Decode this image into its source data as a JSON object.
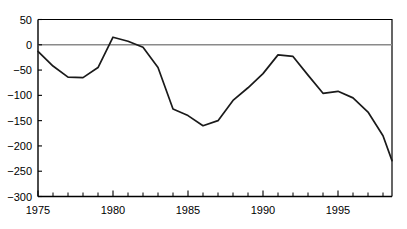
{
  "chart_data": {
    "type": "line",
    "title": "",
    "subtitle": "",
    "xlabel": "",
    "ylabel": "",
    "xlim": [
      1975,
      1998.6
    ],
    "ylim": [
      -300,
      50
    ],
    "grid": false,
    "legend": null,
    "zero_reference_line": 0,
    "y_ticks": [
      50,
      0,
      -50,
      -100,
      -150,
      -200,
      -250,
      -300
    ],
    "y_tick_labels": [
      "50",
      "0",
      "-50",
      "-100",
      "-150",
      "-200",
      "-250",
      "-300"
    ],
    "x_ticks": [
      1975,
      1980,
      1985,
      1990,
      1995
    ],
    "x_tick_labels": [
      "1975",
      "1980",
      "1985",
      "1990",
      "1995"
    ],
    "x_minor_tick_step": 1,
    "series": [
      {
        "name": "series-1",
        "color": "#1a1a1a",
        "x": [
          1975,
          1976,
          1977,
          1978,
          1979,
          1980,
          1981,
          1982,
          1983,
          1984,
          1985,
          1986,
          1987,
          1988,
          1989,
          1990,
          1991,
          1992,
          1993,
          1994,
          1995,
          1996,
          1997,
          1998,
          1998.6
        ],
        "values": [
          -13,
          -42,
          -64,
          -65,
          -45,
          15,
          7,
          -5,
          -45,
          -127,
          -140,
          -160,
          -150,
          -110,
          -85,
          -57,
          -20,
          -23,
          -60,
          -96,
          -92,
          -105,
          -133,
          -180,
          -229
        ]
      }
    ]
  },
  "axis_colors": {
    "axis": "#000000",
    "zero_line": "#8a8a8a",
    "series": "#1a1a1a",
    "background": "#ffffff"
  }
}
